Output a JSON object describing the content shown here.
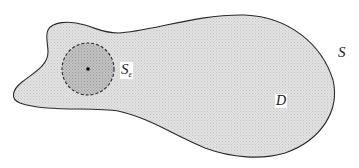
{
  "figure": {
    "colors": {
      "region_fill": "#d9d9d9",
      "sphere_fill": "#b8b8b8",
      "outline": "#2a2a2a",
      "center_point": "#000000",
      "background": "#ffffff"
    },
    "labels": {
      "boundary": "S",
      "region": "D",
      "small_sphere_main": "S",
      "small_sphere_subscript": "ε"
    },
    "small_sphere": {
      "center": [
        88,
        69
      ],
      "radius": 26,
      "style": "dashed"
    }
  }
}
